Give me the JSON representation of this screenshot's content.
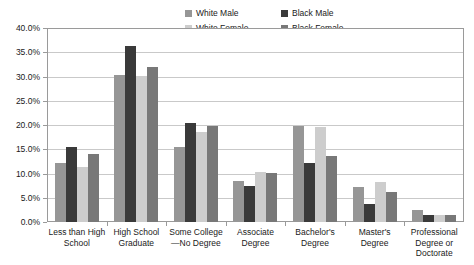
{
  "chart_data": {
    "type": "bar",
    "title": "",
    "xlabel": "",
    "ylabel": "",
    "ylim": [
      0,
      40
    ],
    "ytick_labels": [
      "40.0%",
      "35.0%",
      "30.0%",
      "25.0%",
      "20.0%",
      "15.0%",
      "10.0%",
      "5.0%",
      "0.0%"
    ],
    "ytick_values": [
      40,
      35,
      30,
      25,
      20,
      15,
      10,
      5,
      0
    ],
    "grid": true,
    "legend_position": "top",
    "categories": [
      "Less than High School",
      "High School Graduate",
      "Some College —No Degree",
      "Associate Degree",
      "Bachelor's Degree",
      "Master's Degree",
      "Professional Degree or Doctorate"
    ],
    "category_lines": [
      [
        "Less than High",
        "School"
      ],
      [
        "High School",
        "Graduate"
      ],
      [
        "Some College",
        "—No Degree"
      ],
      [
        "Associate",
        "Degree"
      ],
      [
        "Bachelor's",
        "Degree"
      ],
      [
        "Master's",
        "Degree"
      ],
      [
        "Professional",
        "Degree or",
        "Doctorate"
      ]
    ],
    "series": [
      {
        "name": "White Male",
        "color": "#969696",
        "values": [
          12.2,
          30.3,
          15.5,
          8.5,
          19.8,
          7.2,
          2.5
        ]
      },
      {
        "name": "Black Male",
        "color": "#3a3a3a",
        "values": [
          15.4,
          36.3,
          20.5,
          7.5,
          12.2,
          3.7,
          1.5
        ]
      },
      {
        "name": "White Female",
        "color": "#cdcdcd",
        "values": [
          11.3,
          30.2,
          18.5,
          10.3,
          19.5,
          8.3,
          1.5
        ]
      },
      {
        "name": "Black Female",
        "color": "#787878",
        "values": [
          14.1,
          32.0,
          19.8,
          10.2,
          13.7,
          6.1,
          1.4
        ]
      }
    ]
  },
  "legend": {
    "items": [
      {
        "label": "White Male",
        "color": "#969696"
      },
      {
        "label": "Black Male",
        "color": "#3a3a3a"
      },
      {
        "label": "White Female",
        "color": "#cdcdcd"
      },
      {
        "label": "Black Female",
        "color": "#787878"
      }
    ]
  }
}
